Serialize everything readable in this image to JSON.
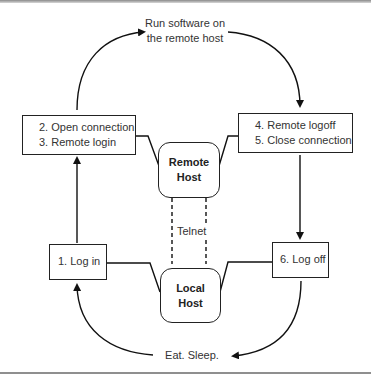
{
  "diagram": {
    "top_label": [
      "Run software on",
      "the remote host"
    ],
    "bottom_label": "Eat. Sleep.",
    "steps": {
      "box_open": [
        "2. Open connection",
        "3. Remote login"
      ],
      "box_close": [
        "4. Remote logoff",
        "5. Close connection"
      ],
      "box_login": "1. Log in",
      "box_logoff": "6. Log off"
    },
    "remote_host": [
      "Remote",
      "Host"
    ],
    "local_host": [
      "Local",
      "Host"
    ],
    "link_label": "Telnet"
  }
}
